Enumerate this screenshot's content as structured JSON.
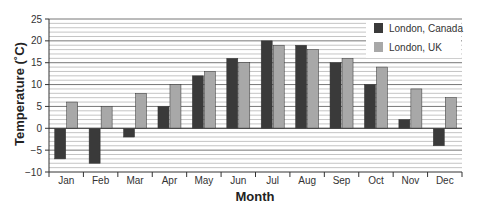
{
  "chart_data": {
    "type": "bar",
    "title": "",
    "xlabel": "Month",
    "ylabel": "Temperature (˚C)",
    "categories": [
      "Jan",
      "Feb",
      "Mar",
      "Apr",
      "May",
      "Jun",
      "Jul",
      "Aug",
      "Sep",
      "Oct",
      "Nov",
      "Dec"
    ],
    "series": [
      {
        "name": "London, Canada",
        "color": "#3a3a3a",
        "values": [
          -7,
          -8,
          -2,
          5,
          12,
          16,
          20,
          19,
          15,
          10,
          2,
          -4
        ]
      },
      {
        "name": "London, UK",
        "color": "#a8a8a8",
        "values": [
          6,
          5,
          8,
          10,
          13,
          15,
          19,
          18,
          16,
          14,
          9,
          7
        ]
      }
    ],
    "ylim": [
      -10,
      25
    ],
    "yticks": [
      -10,
      -5,
      0,
      5,
      10,
      15,
      20,
      25
    ],
    "grid": true,
    "legend_position": "top-right"
  }
}
